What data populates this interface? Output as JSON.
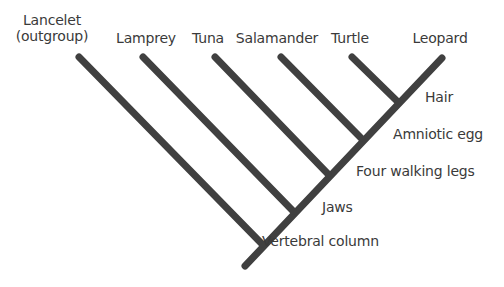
{
  "diagram": {
    "type": "cladogram",
    "line_color": "#404040",
    "text_color": "#3a3a3a",
    "taxa": [
      {
        "name": "Lancelet",
        "sub": "(outgroup)",
        "x": 52,
        "y": 12
      },
      {
        "name": "Lamprey",
        "x": 146,
        "y": 30
      },
      {
        "name": "Tuna",
        "x": 208,
        "y": 30
      },
      {
        "name": "Salamander",
        "x": 277,
        "y": 30
      },
      {
        "name": "Turtle",
        "x": 350,
        "y": 30
      },
      {
        "name": "Leopard",
        "x": 440,
        "y": 30
      }
    ],
    "characters": [
      {
        "name": "Vertebral column",
        "x": 262,
        "y": 233
      },
      {
        "name": "Jaws",
        "x": 322,
        "y": 199
      },
      {
        "name": "Four walking legs",
        "x": 356,
        "y": 163
      },
      {
        "name": "Amniotic egg",
        "x": 393,
        "y": 126
      },
      {
        "name": "Hair",
        "x": 425,
        "y": 89
      }
    ],
    "trunk": {
      "x1": 245,
      "y1": 266,
      "x2": 442,
      "y2": 58
    },
    "branches": [
      {
        "taxon": "Lancelet",
        "x1": 79,
        "y1": 57,
        "x2": 262,
        "y2": 244
      },
      {
        "taxon": "Lamprey",
        "x1": 143,
        "y1": 57,
        "x2": 293,
        "y2": 211
      },
      {
        "taxon": "Tuna",
        "x1": 215,
        "y1": 57,
        "x2": 328,
        "y2": 174
      },
      {
        "taxon": "Salamander",
        "x1": 281,
        "y1": 57,
        "x2": 361,
        "y2": 138
      },
      {
        "taxon": "Turtle",
        "x1": 352,
        "y1": 57,
        "x2": 397,
        "y2": 101
      }
    ]
  }
}
